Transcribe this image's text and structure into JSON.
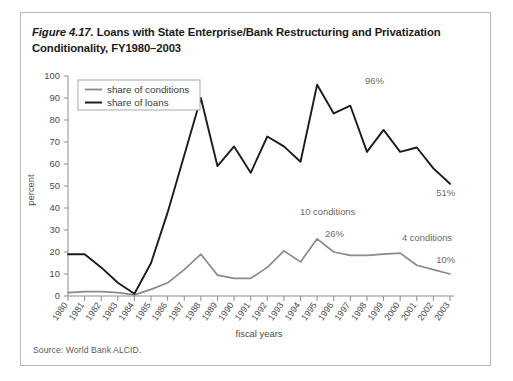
{
  "figure": {
    "number": "Figure 4.17.",
    "caption": " Loans with State Enterprise/Bank Restructuring and Privatization Conditionality, FY1980–2003",
    "source": "Source: World Bank ALCID."
  },
  "legend": {
    "position": "top-left-inside",
    "items": [
      {
        "label": "share of conditions",
        "color": "#8a8a8a"
      },
      {
        "label": "share of loans",
        "color": "#1c1c1c"
      }
    ]
  },
  "annotations": [
    {
      "id": "peak-loans",
      "text": "96%",
      "year": 1995,
      "value": 96
    },
    {
      "id": "end-loans",
      "text": "51%",
      "year": 2003,
      "value": 51
    },
    {
      "id": "conditions-count-10",
      "text": "10 conditions",
      "year": 1995
    },
    {
      "id": "peak-conditions",
      "text": "26%",
      "year": 1995,
      "value": 26
    },
    {
      "id": "conditions-count-4",
      "text": "4 conditions",
      "year": 2002
    },
    {
      "id": "end-conditions",
      "text": "10%",
      "year": 2003,
      "value": 10
    }
  ],
  "chart_data": {
    "type": "line",
    "title": "Loans with State Enterprise/Bank Restructuring and Privatization Conditionality, FY1980–2003",
    "xlabel": "fiscal years",
    "ylabel": "percent",
    "ylim": [
      0,
      100
    ],
    "yticks": [
      0,
      10,
      20,
      30,
      40,
      50,
      60,
      70,
      80,
      90,
      100
    ],
    "grid": false,
    "legend_position": "upper left",
    "categories": [
      "1980",
      "1981",
      "1982",
      "1983",
      "1984",
      "1985",
      "1986",
      "1987",
      "1988",
      "1989",
      "1990",
      "1991",
      "1992",
      "1993",
      "1994",
      "1995",
      "1996",
      "1997",
      "1998",
      "1999",
      "2000",
      "2001",
      "2002",
      "2003"
    ],
    "series": [
      {
        "name": "share of conditions",
        "color": "#8a8a8a",
        "values": [
          1.5,
          2,
          2,
          1.5,
          0.5,
          3,
          6,
          12,
          19,
          9.5,
          8,
          8,
          13,
          20.5,
          15.5,
          26,
          20,
          18.5,
          18.5,
          19,
          19.5,
          14,
          12,
          10
        ]
      },
      {
        "name": "share of loans",
        "color": "#1c1c1c",
        "values": [
          19,
          19,
          13,
          6,
          1,
          15,
          38,
          64,
          90,
          59,
          68,
          56,
          72.5,
          68,
          61,
          96,
          83,
          86.5,
          65.5,
          75.5,
          65.5,
          67.5,
          58,
          51
        ]
      }
    ]
  }
}
